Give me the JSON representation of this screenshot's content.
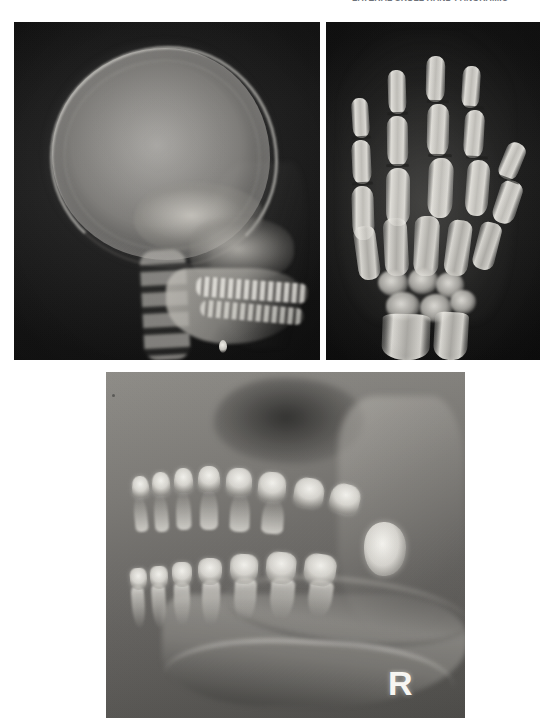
{
  "figure": {
    "caption_top_clipped": "LATERAL SKULL  HAND  PANORAMIC",
    "background_color": "#ffffff",
    "panel_count": 3
  },
  "panels": {
    "skull": {
      "name": "lateral cephalometric skull radiograph",
      "modality": "plain radiograph",
      "projection": "lateral",
      "region": "skull / craniofacial",
      "background_color": "#101010",
      "bone_color": "#e2e0da",
      "position": {
        "x": 14,
        "y": 22,
        "width": 306,
        "height": 338
      },
      "structures": [
        "cranial vault",
        "frontal bone",
        "occipital bone",
        "skull base",
        "sella turcica",
        "maxilla",
        "mandible",
        "dental arches",
        "cervical spine",
        "soft tissue facial profile",
        "radiopaque marker"
      ]
    },
    "hand": {
      "name": "hand and wrist radiograph",
      "modality": "plain radiograph",
      "projection": "posteroanterior",
      "region": "hand / wrist",
      "background_color": "#0e0e0e",
      "bone_color": "#eeece6",
      "position": {
        "x": 326,
        "y": 22,
        "width": 214,
        "height": 338
      },
      "structures": [
        "distal phalanges",
        "middle phalanges",
        "proximal phalanges",
        "metacarpals",
        "carpal bones",
        "distal radius",
        "distal ulna",
        "growth plates"
      ],
      "digit_count": 5
    },
    "panoramic": {
      "name": "dental panoramic radiograph",
      "modality": "panoramic radiograph",
      "projection": "panoramic",
      "region": "jaws / dentition",
      "background_color": "#7c7a76",
      "bone_color": "#faf9f4",
      "position": {
        "x": 106,
        "y": 372,
        "width": 359,
        "height": 346
      },
      "laterality_marker": "R",
      "structures": [
        "maxillary sinus",
        "maxillary teeth",
        "mandibular teeth",
        "tooth roots",
        "mandibular ramus",
        "mandibular canal",
        "inferior cortical border",
        "impacted third molar"
      ]
    }
  },
  "hand_bones": {
    "digits": [
      {
        "label": "index finger",
        "phalanges": [
          {
            "x": 26,
            "y": 76,
            "w": 17,
            "h": 40,
            "rot": -4
          },
          {
            "x": 26,
            "y": 118,
            "w": 19,
            "h": 44,
            "rot": -3
          },
          {
            "x": 26,
            "y": 164,
            "w": 22,
            "h": 54,
            "rot": -2
          }
        ],
        "physes": [
          {
            "x": 26,
            "y": 114,
            "w": 19,
            "rot": -4
          },
          {
            "x": 26,
            "y": 160,
            "w": 21,
            "rot": -3
          }
        ]
      },
      {
        "label": "middle finger",
        "phalanges": [
          {
            "x": 62,
            "y": 48,
            "w": 18,
            "h": 44,
            "rot": -2
          },
          {
            "x": 61,
            "y": 94,
            "w": 21,
            "h": 50,
            "rot": -1
          },
          {
            "x": 60,
            "y": 146,
            "w": 24,
            "h": 58,
            "rot": 0
          }
        ],
        "physes": [
          {
            "x": 61,
            "y": 90,
            "w": 21,
            "rot": -2
          },
          {
            "x": 60,
            "y": 142,
            "w": 23,
            "rot": -1
          }
        ]
      },
      {
        "label": "ring finger",
        "phalanges": [
          {
            "x": 100,
            "y": 34,
            "w": 19,
            "h": 46,
            "rot": 1
          },
          {
            "x": 101,
            "y": 82,
            "w": 22,
            "h": 52,
            "rot": 1
          },
          {
            "x": 102,
            "y": 136,
            "w": 25,
            "h": 60,
            "rot": 2
          }
        ],
        "physes": [
          {
            "x": 101,
            "y": 78,
            "w": 22,
            "rot": 1
          },
          {
            "x": 102,
            "y": 132,
            "w": 24,
            "rot": 1
          }
        ]
      },
      {
        "label": "little finger",
        "phalanges": [
          {
            "x": 136,
            "y": 44,
            "w": 18,
            "h": 42,
            "rot": 3
          },
          {
            "x": 138,
            "y": 88,
            "w": 20,
            "h": 48,
            "rot": 3
          },
          {
            "x": 140,
            "y": 138,
            "w": 23,
            "h": 56,
            "rot": 4
          }
        ],
        "physes": [
          {
            "x": 138,
            "y": 84,
            "w": 20,
            "rot": 3
          },
          {
            "x": 140,
            "y": 134,
            "w": 22,
            "rot": 3
          }
        ]
      },
      {
        "label": "thumb",
        "phalanges": [
          {
            "x": 176,
            "y": 120,
            "w": 20,
            "h": 38,
            "rot": 22
          },
          {
            "x": 170,
            "y": 158,
            "w": 23,
            "h": 44,
            "rot": 18
          }
        ],
        "physes": [
          {
            "x": 172,
            "y": 156,
            "w": 22,
            "rot": 20
          }
        ]
      }
    ],
    "metacarpals": [
      {
        "x": 30,
        "y": 204,
        "w": 22,
        "h": 54,
        "rot": -8
      },
      {
        "x": 58,
        "y": 196,
        "w": 24,
        "h": 58,
        "rot": -3
      },
      {
        "x": 88,
        "y": 194,
        "w": 25,
        "h": 60,
        "rot": 2
      },
      {
        "x": 120,
        "y": 198,
        "w": 24,
        "h": 56,
        "rot": 7
      },
      {
        "x": 150,
        "y": 200,
        "w": 22,
        "h": 48,
        "rot": 14
      }
    ],
    "carpals": [
      {
        "x": 52,
        "y": 248,
        "w": 30,
        "h": 26,
        "r": "50% 46% 44% 52% / 48% 50% 46% 52%"
      },
      {
        "x": 82,
        "y": 246,
        "w": 30,
        "h": 26,
        "r": "46% 52% 50% 44% / 52% 46% 50% 48%"
      },
      {
        "x": 110,
        "y": 250,
        "w": 28,
        "h": 26,
        "r": "52% 44% 48% 50% / 46% 52% 48% 50%"
      },
      {
        "x": 60,
        "y": 270,
        "w": 34,
        "h": 28,
        "r": "48% 50% 46% 52% / 50% 48% 52% 46%"
      },
      {
        "x": 94,
        "y": 272,
        "w": 32,
        "h": 28,
        "r": "50% 46% 52% 48% / 48% 52% 46% 50%"
      },
      {
        "x": 124,
        "y": 268,
        "w": 26,
        "h": 24,
        "r": "46% 52% 48% 50% / 52% 46% 50% 48%"
      }
    ],
    "forearm": [
      {
        "label": "radius",
        "x": 56,
        "y": 292,
        "w": 48,
        "h": 46,
        "rot": 2
      },
      {
        "label": "ulna",
        "x": 108,
        "y": 290,
        "w": 34,
        "h": 48,
        "rot": 3
      }
    ]
  },
  "panoramic_teeth": {
    "upper": [
      {
        "x": 26,
        "y": 104,
        "w": 17,
        "h": 22,
        "r": "42% 42% 34% 34% / 48% 48% 30% 30%",
        "rot": -6
      },
      {
        "x": 46,
        "y": 100,
        "w": 18,
        "h": 24,
        "r": "44% 44% 32% 32% / 46% 46% 32% 32%",
        "rot": -4
      },
      {
        "x": 68,
        "y": 96,
        "w": 19,
        "h": 25,
        "r": "44% 44% 34% 34% / 48% 48% 30% 30%",
        "rot": -2
      },
      {
        "x": 92,
        "y": 94,
        "w": 22,
        "h": 26,
        "r": "42% 42% 36% 36% / 46% 46% 32% 32%",
        "rot": 0
      },
      {
        "x": 120,
        "y": 96,
        "w": 26,
        "h": 28,
        "r": "40% 40% 38% 38% / 44% 44% 34% 34%",
        "rot": 2
      },
      {
        "x": 152,
        "y": 100,
        "w": 28,
        "h": 30,
        "r": "40% 40% 38% 38% / 44% 44% 34% 34%",
        "rot": 4
      },
      {
        "x": 188,
        "y": 106,
        "w": 30,
        "h": 30,
        "r": "40% 42% 38% 36% / 44% 46% 34% 32%",
        "rot": 8
      },
      {
        "x": 224,
        "y": 112,
        "w": 30,
        "h": 30,
        "r": "42% 40% 36% 38% / 46% 44% 32% 34%",
        "rot": 14
      }
    ],
    "upper_roots": [
      {
        "x": 28,
        "y": 122,
        "w": 13,
        "h": 38,
        "rot": -6
      },
      {
        "x": 48,
        "y": 120,
        "w": 14,
        "h": 40,
        "rot": -4
      },
      {
        "x": 70,
        "y": 118,
        "w": 15,
        "h": 40,
        "rot": -2
      },
      {
        "x": 94,
        "y": 116,
        "w": 18,
        "h": 42,
        "rot": 0
      },
      {
        "x": 124,
        "y": 120,
        "w": 20,
        "h": 40,
        "rot": 2
      },
      {
        "x": 156,
        "y": 126,
        "w": 22,
        "h": 36,
        "rot": 4
      }
    ],
    "lower": [
      {
        "x": 24,
        "y": 196,
        "w": 17,
        "h": 22,
        "r": "34% 34% 42% 42% / 30% 30% 48% 48%",
        "rot": -4
      },
      {
        "x": 44,
        "y": 194,
        "w": 18,
        "h": 23,
        "r": "34% 34% 44% 44% / 30% 30% 46% 46%",
        "rot": -3
      },
      {
        "x": 66,
        "y": 190,
        "w": 20,
        "h": 25,
        "r": "34% 34% 44% 44% / 30% 30% 48% 48%",
        "rot": -1
      },
      {
        "x": 92,
        "y": 186,
        "w": 24,
        "h": 27,
        "r": "36% 36% 42% 42% / 32% 32% 46% 46%",
        "rot": 1
      },
      {
        "x": 124,
        "y": 182,
        "w": 28,
        "h": 30,
        "r": "36% 36% 42% 42% / 32% 32% 46% 46%",
        "rot": 3
      },
      {
        "x": 160,
        "y": 180,
        "w": 30,
        "h": 32,
        "r": "38% 36% 40% 42% / 34% 32% 44% 46%",
        "rot": 5
      },
      {
        "x": 198,
        "y": 182,
        "w": 32,
        "h": 32,
        "r": "38% 38% 40% 40% / 34% 34% 44% 44%",
        "rot": 8
      }
    ],
    "lower_roots": [
      {
        "x": 26,
        "y": 214,
        "w": 13,
        "h": 42,
        "rot": -4
      },
      {
        "x": 46,
        "y": 212,
        "w": 14,
        "h": 44,
        "rot": -3
      },
      {
        "x": 68,
        "y": 210,
        "w": 16,
        "h": 44,
        "rot": -1
      },
      {
        "x": 96,
        "y": 208,
        "w": 18,
        "h": 46,
        "rot": 1
      },
      {
        "x": 128,
        "y": 206,
        "w": 22,
        "h": 44,
        "rot": 3
      },
      {
        "x": 164,
        "y": 206,
        "w": 24,
        "h": 42,
        "rot": 5
      },
      {
        "x": 202,
        "y": 208,
        "w": 24,
        "h": 38,
        "rot": 8
      }
    ]
  }
}
